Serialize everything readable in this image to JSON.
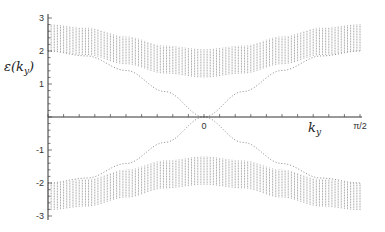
{
  "chart_data": {
    "type": "line",
    "title": "",
    "xlabel": "k_y",
    "ylabel": "ε(k_y)",
    "xlim": [
      -1.5708,
      1.5708
    ],
    "ylim": [
      -3.1,
      3.1
    ],
    "grid": false,
    "legend": null,
    "y_ticks": [
      {
        "value": 3,
        "label": "3"
      },
      {
        "value": 2,
        "label": "2"
      },
      {
        "value": 1,
        "label": "1"
      },
      {
        "value": -1,
        "label": "-1"
      },
      {
        "value": -2,
        "label": "-2"
      },
      {
        "value": -3,
        "label": "-3"
      }
    ],
    "x_ticks": [
      {
        "value": 0,
        "label": "0"
      },
      {
        "value": 1.5708,
        "label": "π/2"
      }
    ],
    "x_minor_tick_step": 0.15708,
    "series": [
      {
        "name": "upper bulk band",
        "style": "vertical-hatched band",
        "color": "#9a9a9a",
        "x": [
          -1.5708,
          -1.1781,
          -0.7854,
          -0.3927,
          0,
          0.3927,
          0.7854,
          1.1781,
          1.5708
        ],
        "lower": [
          2.0,
          1.88,
          1.6,
          1.32,
          1.2,
          1.32,
          1.6,
          1.88,
          2.0
        ],
        "upper": [
          2.82,
          2.71,
          2.44,
          2.16,
          2.05,
          2.16,
          2.44,
          2.71,
          2.82
        ]
      },
      {
        "name": "lower bulk band",
        "style": "vertical-hatched band",
        "color": "#9a9a9a",
        "x": [
          -1.5708,
          -1.1781,
          -0.7854,
          -0.3927,
          0,
          0.3927,
          0.7854,
          1.1781,
          1.5708
        ],
        "lower": [
          -2.82,
          -2.71,
          -2.44,
          -2.16,
          -2.05,
          -2.16,
          -2.44,
          -2.71,
          -2.82
        ],
        "upper": [
          -2.0,
          -1.88,
          -1.6,
          -1.32,
          -1.2,
          -1.32,
          -1.6,
          -1.88,
          -2.0
        ]
      },
      {
        "name": "edge state (+)",
        "style": "dotted",
        "color": "#888888",
        "x": [
          -1.5708,
          -1.1781,
          -0.7854,
          -0.3927,
          0,
          0.3927,
          0.7854,
          1.1781,
          1.5708
        ],
        "values": [
          2.0,
          1.85,
          1.41,
          0.77,
          0,
          -0.77,
          -1.41,
          -1.85,
          -2.0
        ]
      },
      {
        "name": "edge state (-)",
        "style": "dotted",
        "color": "#888888",
        "x": [
          -1.5708,
          -1.1781,
          -0.7854,
          -0.3927,
          0,
          0.3927,
          0.7854,
          1.1781,
          1.5708
        ],
        "values": [
          -2.0,
          -1.85,
          -1.41,
          -0.77,
          0,
          0.77,
          1.41,
          1.85,
          2.0
        ]
      }
    ]
  },
  "labels": {
    "ylabel_main": "ε(k",
    "ylabel_sub": "y",
    "ylabel_close": ")",
    "xlabel_main": "k",
    "xlabel_sub": "y"
  }
}
